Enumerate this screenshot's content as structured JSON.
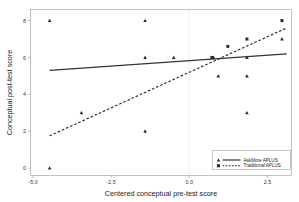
{
  "chart_data": {
    "type": "scatter",
    "title": "",
    "xlabel": "Centered conceptual pre-test score",
    "ylabel": "Conceptual post-test score",
    "xlim": [
      -5.6,
      2.6
    ],
    "ylim": [
      -0.4,
      8.6
    ],
    "xticks": [
      -5.0,
      -2.5,
      0.0,
      2.5
    ],
    "xticklabels": [
      "-5.0",
      "-2.5",
      "0.0",
      "2.5"
    ],
    "yticks": [
      0,
      2,
      4,
      6,
      8
    ],
    "yticklabels": [
      "0",
      "2",
      "4",
      "6",
      "8"
    ],
    "grid": false,
    "reference_lines": [
      {
        "orientation": "vertical",
        "value": 0.0,
        "style": "dotted"
      }
    ],
    "legend": {
      "position": "bottom-right",
      "entries": [
        {
          "label": "AskMore APLUS",
          "marker": "triangle",
          "line": "solid"
        },
        {
          "label": "Traditional APLUS",
          "marker": "square",
          "line": "dashed"
        }
      ]
    },
    "series": [
      {
        "name": "AskMore APLUS",
        "marker": "triangle",
        "line": "solid",
        "fit_line": {
          "x": [
            -5.0,
            2.45
          ],
          "y": [
            5.3,
            6.2
          ]
        },
        "points": [
          {
            "x": -5.0,
            "y": 8.0
          },
          {
            "x": -5.0,
            "y": 0.0
          },
          {
            "x": -4.0,
            "y": 3.0
          },
          {
            "x": -2.0,
            "y": 8.0
          },
          {
            "x": -2.0,
            "y": 6.0
          },
          {
            "x": -2.0,
            "y": 2.0
          },
          {
            "x": -1.1,
            "y": 6.0
          },
          {
            "x": 0.15,
            "y": 6.0
          },
          {
            "x": 0.3,
            "y": 5.0
          },
          {
            "x": 1.2,
            "y": 6.0
          },
          {
            "x": 1.2,
            "y": 5.0
          },
          {
            "x": 1.2,
            "y": 3.0
          },
          {
            "x": 2.3,
            "y": 7.0
          }
        ]
      },
      {
        "name": "Traditional APLUS",
        "marker": "square",
        "line": "dashed",
        "fit_line": {
          "x": [
            -5.0,
            2.45
          ],
          "y": [
            1.75,
            7.6
          ]
        },
        "points": [
          {
            "x": 0.1,
            "y": 6.0
          },
          {
            "x": 1.2,
            "y": 7.0
          },
          {
            "x": 2.3,
            "y": 8.0
          },
          {
            "x": 0.6,
            "y": 6.6
          }
        ]
      }
    ]
  }
}
